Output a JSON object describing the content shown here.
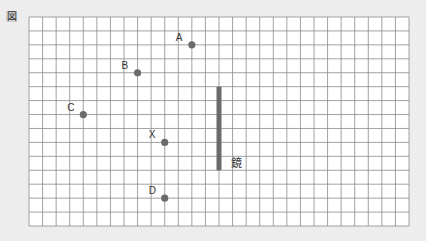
{
  "figure_label": "図",
  "grid": {
    "columns": 28,
    "rows": 15
  },
  "colors": {
    "background": "#ededed",
    "grid_fill": "#ffffff",
    "grid_line": "#8a8a8a",
    "point": "#6b6b6b",
    "mirror": "#6b6b6b",
    "text": "#333333"
  },
  "points": [
    {
      "label": "A",
      "col": 12,
      "row": 2
    },
    {
      "label": "B",
      "col": 8,
      "row": 4
    },
    {
      "label": "C",
      "col": 4,
      "row": 7
    },
    {
      "label": "X",
      "col": 10,
      "row": 9
    },
    {
      "label": "D",
      "col": 10,
      "row": 13
    }
  ],
  "mirror": {
    "label": "鏡",
    "col": 14,
    "row_start": 5,
    "row_end": 11
  }
}
